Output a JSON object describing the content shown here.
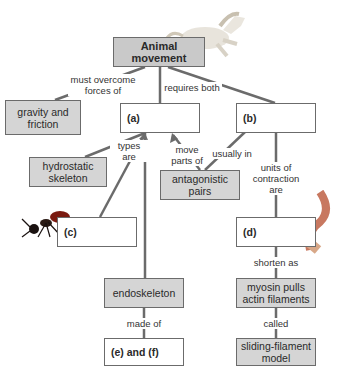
{
  "nodes": {
    "root": "Animal movement",
    "gravity": "gravity and friction",
    "a": "(a)",
    "b": "(b)",
    "hydrostatic": "hydrostatic skeleton",
    "antagonistic": "antagonistic pairs",
    "c": "(c)",
    "d": "(d)",
    "endoskeleton": "endoskeleton",
    "myosin": "myosin pulls actin filaments",
    "ef": "(e) and (f)",
    "sliding": "sliding-filament model"
  },
  "links": {
    "must_overcome": "must overcome forces of",
    "requires_both": "requires both",
    "types_are": "types are",
    "move_parts_of": "move parts of",
    "usually_in": "usually in",
    "units_of_contraction": "units of contraction are",
    "shorten_as": "shorten as",
    "made_of": "made of",
    "called": "called"
  },
  "images": [
    "horse-photo",
    "ant-photo",
    "muscle-fiber-illustration"
  ]
}
